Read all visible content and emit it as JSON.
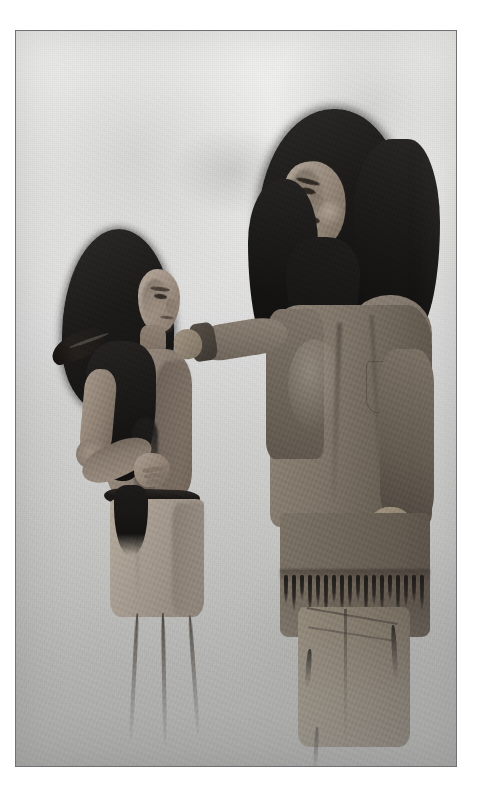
{
  "artwork": {
    "medium": "grayscale painted illustration",
    "title_visible": "",
    "caption_visible": "",
    "signature_visible": "",
    "frame": {
      "border_color": "#6f7173",
      "border_width_px": 1,
      "page_background": "#ffffff",
      "x": 15,
      "y": 30,
      "width": 442,
      "height": 737
    },
    "palette": {
      "page_white": "#ffffff",
      "sky_light": "#f2f2f0",
      "background_mid": "#d2d2d1",
      "ground_dark": "#aeaeae",
      "hair_black": "#141312",
      "skin_light": "#b4a79a",
      "skin_mid": "#8b7e72",
      "skin_shadow": "#6f6357",
      "garment_tan": "#8e8377",
      "garment_dark": "#554d45",
      "belt_black": "#181614",
      "frame_line": "#6f7173"
    },
    "scene": {
      "subject_count": 2,
      "description": "Two standing figures facing each other against a plain graded background"
    },
    "figures": [
      {
        "id": "left-figure",
        "role": "younger standing figure",
        "position": "left of center",
        "pose": "standing in profile, left hand resting on hip, head turned right",
        "features": [
          "long dark hair falling past the shoulders",
          "dark feather ornament angled out from the hair",
          "bare chest and torso",
          "wide dark belt at the waist",
          "pale fringed kilt to the knee",
          "long dark fringe hanging at the hip"
        ]
      },
      {
        "id": "right-figure",
        "role": "taller standing figure",
        "position": "right of center",
        "pose": "standing, head bowed and turned left, speaking; one arm extended to the other figure's shoulder, other arm hanging at the side",
        "features": [
          "very long thick dark hair framing the face",
          "mouth open, in mid-speech",
          "long sleeved tunic of tan hide",
          "fringed hem across the hips",
          "fringed leggings below",
          "hand resting on the younger figure's shoulder"
        ]
      }
    ],
    "background": {
      "type": "plain graded wash",
      "top_tone": "near-white",
      "bottom_tone": "mid grey",
      "marks": [
        "faint soft smudge upper-left",
        "faint soft smudge upper-center"
      ]
    }
  }
}
